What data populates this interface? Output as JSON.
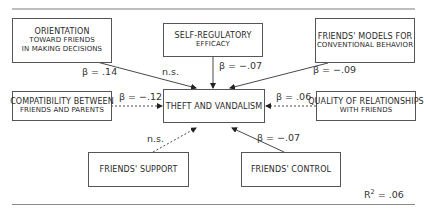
{
  "diagram": {
    "outcome": {
      "line1": "Theft and vandalism"
    },
    "predictors": [
      {
        "id": "orientation",
        "lines": [
          "Orientation",
          "toward friends",
          "in making decisions"
        ],
        "coef": "β = .14",
        "path": "solid"
      },
      {
        "id": "self_regulatory",
        "lines": [
          "Self-regulatory",
          "efficacy"
        ],
        "coef": "β = −.07",
        "path": "solid"
      },
      {
        "id": "friends_models",
        "lines": [
          "Friends' models for",
          "conventional behavior"
        ],
        "coef": "β = −.09",
        "path": "solid"
      },
      {
        "id": "compatibility",
        "lines": [
          "Compatibility between",
          "friends and parents"
        ],
        "coef": "β = −.12",
        "path": "dashed"
      },
      {
        "id": "quality",
        "lines": [
          "Quality of relationships",
          "with friends"
        ],
        "coef": "β = .06",
        "path": "dashed"
      },
      {
        "id": "friends_support",
        "lines": [
          "Friends' support"
        ],
        "coef": "n.s.",
        "path": "dashed"
      },
      {
        "id": "friends_control",
        "lines": [
          "Friends' control"
        ],
        "coef": "β = −.07",
        "path": "solid"
      }
    ],
    "extra_labels": {
      "ns_top": "n.s."
    },
    "r_squared": {
      "label": "R",
      "sup": "2",
      "value": " = .06"
    }
  }
}
